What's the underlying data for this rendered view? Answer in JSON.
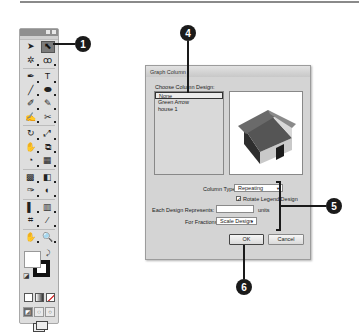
{
  "toolbox": {
    "tools": [
      [
        "selection-tool",
        "direct-selection-tool"
      ],
      [
        "magic-wand-tool",
        "lasso-tool"
      ],
      [
        "pen-tool",
        "type-tool"
      ],
      [
        "line-segment-tool",
        "ellipse-tool"
      ],
      [
        "paintbrush-tool",
        "pencil-tool"
      ],
      [
        "blob-brush-tool",
        "scissors-tool"
      ],
      [
        "rotate-tool",
        "scale-tool"
      ],
      [
        "warp-tool",
        "free-transform-tool"
      ],
      [
        "shape-builder-tool",
        "perspective-grid-tool"
      ],
      [
        "mesh-tool",
        "gradient-tool"
      ],
      [
        "eyedropper-tool",
        "blend-tool"
      ],
      [
        "symbol-sprayer-tool",
        "column-graph-tool"
      ],
      [
        "artboard-tool",
        "slice-tool"
      ],
      [
        "hand-tool",
        "zoom-tool"
      ]
    ],
    "glyphs": [
      [
        "➤",
        "⬉"
      ],
      [
        "✲",
        "ꝏ"
      ],
      [
        "✒",
        "T"
      ],
      [
        "╱",
        "⬬"
      ],
      [
        "✐",
        "✎"
      ],
      [
        "✍",
        "✂"
      ],
      [
        "↻",
        "⤢"
      ],
      [
        "✋",
        "⧉"
      ],
      [
        "◔",
        "▦"
      ],
      [
        "▩",
        "◧"
      ],
      [
        "✑",
        "◐"
      ],
      [
        "▌",
        "▥"
      ],
      [
        "⌗",
        "⁄"
      ],
      [
        "✋",
        "🔍"
      ]
    ],
    "selected_tool": "direct-selection-tool",
    "fill_color": "#ffffff",
    "stroke_color": "#111111"
  },
  "callouts": {
    "c1": "1",
    "c4": "4",
    "c5": "5",
    "c6": "6"
  },
  "dialog": {
    "title": "Graph Column",
    "choose_label": "Choose Column Design:",
    "designs": [
      "None",
      "Green Arrow",
      "house 1"
    ],
    "selected_design": "None",
    "column_type_label": "Column Type:",
    "column_type_value": "Repeating",
    "rotate_legend_label": "Rotate Legend Design",
    "rotate_legend_checked": true,
    "each_design_label": "Each Design Represents:",
    "each_design_value": "",
    "units_label": "units",
    "fractions_label": "For Fractions:",
    "fractions_value": "Scale Design",
    "ok_label": "OK",
    "cancel_label": "Cancel"
  }
}
